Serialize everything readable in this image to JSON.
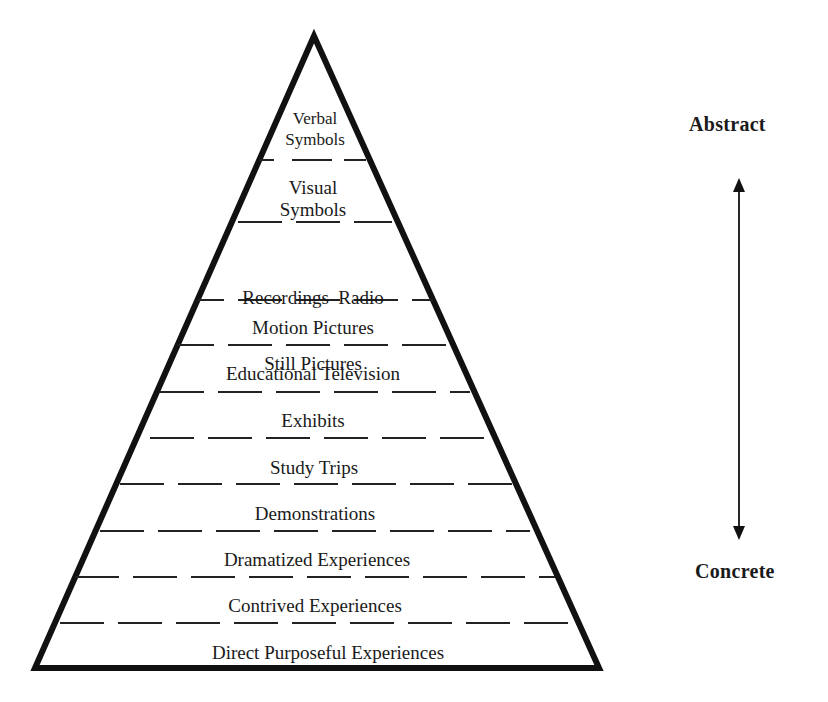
{
  "diagram": {
    "colors": {
      "stroke": "#111111",
      "text": "#1a1a1a",
      "background": "#ffffff"
    },
    "levels": [
      {
        "lines": [
          "Verbal",
          "Symbols"
        ]
      },
      {
        "lines": [
          "Visual",
          "Symbols"
        ]
      },
      {
        "lines": [
          "Recordings  Radio",
          "Still Pictures"
        ]
      },
      {
        "lines": [
          "Motion Pictures"
        ]
      },
      {
        "lines": [
          "Educational Television"
        ]
      },
      {
        "lines": [
          "Exhibits"
        ]
      },
      {
        "lines": [
          "Study Trips"
        ]
      },
      {
        "lines": [
          "Demonstrations"
        ]
      },
      {
        "lines": [
          "Dramatized Experiences"
        ]
      },
      {
        "lines": [
          "Contrived Experiences"
        ]
      },
      {
        "lines": [
          "Direct Purposeful Experiences"
        ]
      }
    ],
    "axis": {
      "top_label": "Abstract",
      "bottom_label": "Concrete",
      "arrow": "double-headed vertical arrow"
    }
  }
}
